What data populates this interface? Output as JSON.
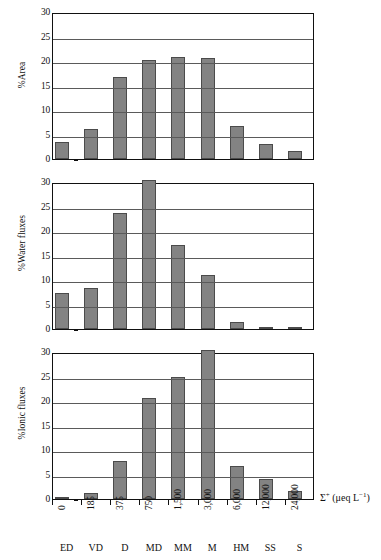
{
  "figure": {
    "bar_color": "#838383",
    "bar_edge_color": "#4b4b4b",
    "axis_color": "#111111",
    "grid_color": "#5a5a5a",
    "background": "#ffffff"
  },
  "axis": {
    "x_title_sigma": "Σ",
    "x_title_plus": "+",
    "x_title_units": "(μeq L",
    "x_title_exp": "−1",
    "x_title_close": ")",
    "x_title_full": "Σ+ (μeq L−1)"
  },
  "chart_data": [
    {
      "type": "bar",
      "title": "",
      "ylabel": "%Area",
      "xlabel": "Σ+ (μeq L−1)",
      "categories": [
        "ED",
        "VD",
        "D",
        "MD",
        "MM",
        "M",
        "HM",
        "SS",
        "S"
      ],
      "x_tick_labels": [
        "0",
        "185",
        "375",
        "750",
        "1,500",
        "3,000",
        "6,000",
        "12,000",
        "24,000"
      ],
      "values": [
        3.4,
        6.2,
        16.8,
        20.3,
        20.8,
        20.7,
        6.7,
        3.0,
        1.6
      ],
      "clipped": [
        false,
        false,
        false,
        false,
        false,
        false,
        false,
        false,
        false
      ],
      "ylim": [
        0,
        30
      ],
      "yticks": [
        0,
        5,
        10,
        15,
        20,
        25,
        30
      ],
      "grid": true,
      "legend": "none"
    },
    {
      "type": "bar",
      "title": "",
      "ylabel": "%Water fluxes",
      "xlabel": "Σ+ (μeq L−1)",
      "categories": [
        "ED",
        "VD",
        "D",
        "MD",
        "MM",
        "M",
        "HM",
        "SS",
        "S"
      ],
      "x_tick_labels": [
        "0",
        "185",
        "375",
        "750",
        "1,500",
        "3,000",
        "6,000",
        "12,000",
        "24,000"
      ],
      "values": [
        7.3,
        8.3,
        23.6,
        30.0,
        17.2,
        11.0,
        1.4,
        0.4,
        0.2
      ],
      "clipped": [
        false,
        false,
        false,
        true,
        false,
        false,
        false,
        false,
        false
      ],
      "ylim": [
        0,
        30
      ],
      "yticks": [
        0,
        5,
        10,
        15,
        20,
        25,
        30
      ],
      "grid": true,
      "legend": "none"
    },
    {
      "type": "bar",
      "title": "",
      "ylabel": "%Ionic fluxes",
      "xlabel": "Σ+ (μeq L−1)",
      "categories": [
        "ED",
        "VD",
        "D",
        "MD",
        "MM",
        "M",
        "HM",
        "SS",
        "S"
      ],
      "x_tick_labels": [
        "0",
        "185",
        "375",
        "750",
        "1,500",
        "3,000",
        "6,000",
        "12,000",
        "24,000"
      ],
      "values": [
        0.5,
        1.3,
        7.7,
        20.7,
        25.0,
        30.0,
        6.7,
        4.1,
        1.7
      ],
      "clipped": [
        false,
        false,
        false,
        false,
        false,
        true,
        false,
        false,
        false
      ],
      "ylim": [
        0,
        30
      ],
      "yticks": [
        0,
        5,
        10,
        15,
        20,
        25,
        30
      ],
      "grid": true,
      "legend": "none"
    }
  ]
}
